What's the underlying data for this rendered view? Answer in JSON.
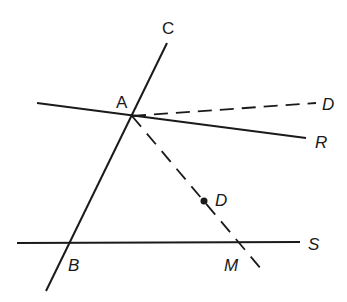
{
  "diagram": {
    "colors": {
      "ink": "#1a1a1a",
      "background": "#ffffff"
    },
    "points": {
      "A": {
        "label": "A",
        "x": 132,
        "y": 116
      },
      "B": {
        "label": "B",
        "x": 69,
        "y": 243
      },
      "M": {
        "label": "M",
        "x": 239,
        "y": 242
      },
      "D_dot": {
        "label": "D",
        "x": 204,
        "y": 201
      }
    },
    "lines": [
      {
        "name": "line-CB",
        "end_label": "C",
        "style": "solid"
      },
      {
        "name": "line-AR",
        "end_label": "R",
        "style": "solid"
      },
      {
        "name": "line-S",
        "end_label": "S",
        "style": "solid"
      },
      {
        "name": "ray-AD",
        "end_label": "D",
        "style": "dashed"
      },
      {
        "name": "ray-AM",
        "style": "dashed"
      }
    ],
    "labels": {
      "C": "C",
      "A": "A",
      "D_top": "D",
      "R": "R",
      "D_dot": "D",
      "S": "S",
      "B": "B",
      "M": "M"
    }
  }
}
